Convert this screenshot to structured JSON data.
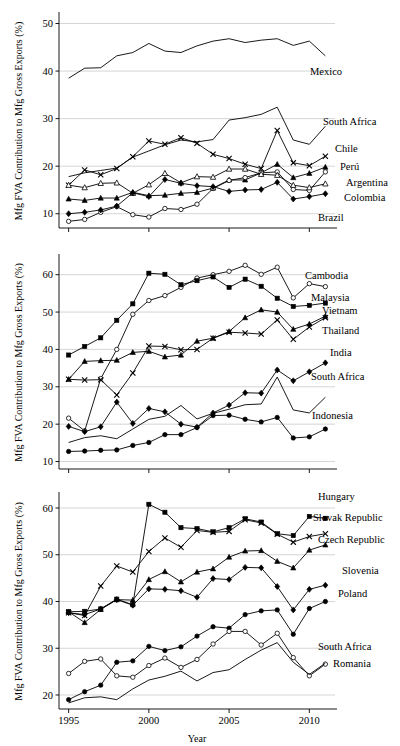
{
  "figure": {
    "xlabel": "Year",
    "ylabel": "Mfg FVA Contribution to Mfg Gross Exports (%)",
    "x_ticks": [
      "1995",
      "2000",
      "2005",
      "2010"
    ],
    "x_tick_values": [
      1995,
      2000,
      2005,
      2010
    ],
    "xlim": [
      1994.4,
      2011.6
    ],
    "grid": "horizontal",
    "legend_position": "right-inline-labels",
    "line_color": "#000000",
    "grid_color": "#b9b9b9"
  },
  "chart_data": [
    {
      "type": "line",
      "panel": "top",
      "title": "",
      "xlabel": "",
      "ylabel": "Mfg FVA Contribution to Mfg Gross Exports (%)",
      "ylim": [
        7,
        52
      ],
      "y_ticks": [
        10,
        20,
        30,
        40,
        50
      ],
      "y_tick_labels": [
        "10",
        "20",
        "30",
        "40",
        "50"
      ],
      "x": [
        1995,
        1996,
        1997,
        1998,
        1999,
        2000,
        2001,
        2002,
        2003,
        2004,
        2005,
        2006,
        2007,
        2008,
        2009,
        2010,
        2011
      ],
      "series": [
        {
          "name": "Mexico",
          "marker": "none",
          "label": "Mexico",
          "values": [
            38.5,
            40.6,
            40.7,
            43.2,
            43.9,
            45.8,
            44.2,
            43.9,
            45.3,
            46.3,
            46.8,
            46.0,
            46.5,
            46.8,
            45.4,
            46.3,
            43.2
          ]
        },
        {
          "name": "South Africa",
          "marker": "none",
          "label": "South Africa",
          "values": [
            17.8,
            18.6,
            19.1,
            19.6,
            21.9,
            23.2,
            24.5,
            25.5,
            25.1,
            25.6,
            29.7,
            30.2,
            30.9,
            32.4,
            25.5,
            24.6,
            28.4
          ]
        },
        {
          "name": "Chile",
          "marker": "x",
          "label": "Chile",
          "values": [
            16.0,
            19.2,
            18.2,
            19.5,
            22.0,
            25.3,
            24.6,
            26.0,
            24.8,
            22.5,
            21.6,
            20.4,
            19.5,
            27.5,
            20.7,
            20.1,
            22.1
          ]
        },
        {
          "name": "Perú",
          "marker": "filled-triangle",
          "label": "Perú",
          "values": [
            13.1,
            12.8,
            13.3,
            13.3,
            14.5,
            13.8,
            13.9,
            14.3,
            14.5,
            15.4,
            17.1,
            17.1,
            18.6,
            20.4,
            17.6,
            18.5,
            19.8
          ]
        },
        {
          "name": "Argentina",
          "marker": "open-circle",
          "label": "Argentina",
          "values": [
            8.4,
            8.8,
            10.3,
            11.5,
            9.8,
            9.3,
            11.1,
            10.9,
            12.0,
            15.3,
            17.0,
            17.6,
            18.6,
            18.8,
            15.1,
            14.9,
            18.8
          ]
        },
        {
          "name": "Colombia",
          "marker": "open-triangle",
          "label": "Colombia",
          "values": [
            16.0,
            15.5,
            16.4,
            16.5,
            14.3,
            16.1,
            18.5,
            16.5,
            17.8,
            17.7,
            19.4,
            19.4,
            18.3,
            18.1,
            16.0,
            15.5,
            16.3
          ]
        },
        {
          "name": "Brazil",
          "marker": "filled-diamond",
          "label": "Brazil",
          "values": [
            10.0,
            10.3,
            10.8,
            11.6,
            14.4,
            13.6,
            17.2,
            16.4,
            15.9,
            15.7,
            14.7,
            15.0,
            15.1,
            16.6,
            13.1,
            13.6,
            14.2
          ]
        }
      ]
    },
    {
      "type": "line",
      "panel": "middle",
      "title": "",
      "xlabel": "",
      "ylabel": "Mfg FVA Contribution to Mfg Gross Exports (%)",
      "ylim": [
        8,
        65
      ],
      "y_ticks": [
        10,
        20,
        30,
        40,
        50,
        60
      ],
      "y_tick_labels": [
        "10",
        "20",
        "30",
        "40",
        "50",
        "60"
      ],
      "x": [
        1995,
        1996,
        1997,
        1998,
        1999,
        2000,
        2001,
        2002,
        2003,
        2004,
        2005,
        2006,
        2007,
        2008,
        2009,
        2010,
        2011
      ],
      "series": [
        {
          "name": "Cambodia",
          "marker": "open-circle",
          "label": "Cambodia",
          "values": [
            21.6,
            18.2,
            32.2,
            40.0,
            49.4,
            53.1,
            54.4,
            56.6,
            59.1,
            60.0,
            60.9,
            62.5,
            60.1,
            62.0,
            53.8,
            57.6,
            56.8
          ]
        },
        {
          "name": "Malaysia",
          "marker": "filled-square",
          "label": "Malaysia",
          "values": [
            38.5,
            40.8,
            43.1,
            47.8,
            52.2,
            60.4,
            60.1,
            57.3,
            58.4,
            59.4,
            56.6,
            58.8,
            56.9,
            53.7,
            51.5,
            51.8,
            52.4
          ]
        },
        {
          "name": "Vietnam",
          "marker": "filled-triangle",
          "label": "Vietnam",
          "values": [
            32.0,
            36.8,
            37.0,
            37.1,
            39.2,
            39.5,
            38.0,
            38.5,
            42.2,
            43.0,
            44.8,
            48.5,
            50.6,
            50.0,
            45.4,
            46.8,
            48.9
          ]
        },
        {
          "name": "Thailand",
          "marker": "x",
          "label": "Thailand",
          "values": [
            32.0,
            31.8,
            31.9,
            27.8,
            33.7,
            40.9,
            40.8,
            39.9,
            40.0,
            43.0,
            44.6,
            44.4,
            44.1,
            47.9,
            42.7,
            46.0,
            48.5
          ]
        },
        {
          "name": "India",
          "marker": "filled-circle",
          "label": "India",
          "values": [
            12.7,
            12.8,
            13.0,
            13.1,
            14.3,
            15.1,
            17.2,
            17.2,
            19.1,
            22.3,
            22.4,
            21.3,
            20.6,
            21.8,
            16.3,
            16.6,
            18.7
          ]
        },
        {
          "name": "South Africa",
          "marker": "filled-diamond",
          "label": "South Africa",
          "values": [
            19.4,
            18.0,
            19.3,
            25.9,
            20.2,
            24.2,
            23.3,
            20.0,
            19.2,
            23.0,
            25.1,
            28.4,
            28.3,
            34.5,
            31.6,
            34.0,
            36.4
          ]
        },
        {
          "name": "Indonesia",
          "marker": "none",
          "label": "Indonesia",
          "values": [
            15.1,
            16.4,
            16.9,
            16.1,
            18.7,
            21.3,
            22.1,
            25.0,
            21.4,
            22.9,
            24.0,
            25.2,
            25.4,
            32.6,
            23.8,
            23.0,
            27.2
          ]
        }
      ]
    },
    {
      "type": "line",
      "panel": "bottom",
      "title": "",
      "xlabel": "Year",
      "ylabel": "Mfg FVA Contribution to Mfg Gross Exports (%)",
      "ylim": [
        17,
        63
      ],
      "y_ticks": [
        20,
        30,
        40,
        50,
        60
      ],
      "y_tick_labels": [
        "20",
        "30",
        "40",
        "50",
        "60"
      ],
      "x": [
        1995,
        1996,
        1997,
        1998,
        1999,
        2000,
        2001,
        2002,
        2003,
        2004,
        2005,
        2006,
        2007,
        2008,
        2009,
        2010,
        2011
      ],
      "series": [
        {
          "name": "Hungary",
          "marker": "filled-square",
          "label": "Hungary",
          "values": [
            37.8,
            37.9,
            38.4,
            40.5,
            39.3,
            60.8,
            59.1,
            55.8,
            55.6,
            54.9,
            55.8,
            57.7,
            57.0,
            54.5,
            54.1,
            58.2,
            57.8
          ]
        },
        {
          "name": "Slovak Republic",
          "marker": "x",
          "label": "Slovak Republic",
          "values": [
            37.6,
            37.0,
            43.3,
            47.6,
            46.3,
            50.7,
            53.6,
            51.6,
            55.2,
            54.8,
            55.0,
            57.5,
            56.8,
            54.4,
            52.7,
            53.9,
            54.5
          ]
        },
        {
          "name": "Czech Republic",
          "marker": "filled-triangle",
          "label": "Czech Republic",
          "values": [
            37.8,
            35.5,
            38.3,
            40.4,
            40.3,
            44.7,
            46.4,
            44.2,
            46.3,
            47.0,
            49.5,
            50.8,
            50.9,
            48.6,
            47.2,
            51.0,
            52.1
          ]
        },
        {
          "name": "Slovenia",
          "marker": "filled-diamond",
          "label": "Slovenia",
          "values": [
            37.6,
            37.2,
            38.4,
            40.4,
            39.2,
            42.7,
            42.6,
            42.3,
            40.9,
            44.9,
            44.7,
            47.3,
            47.2,
            43.2,
            38.2,
            42.6,
            43.5
          ]
        },
        {
          "name": "Poland",
          "marker": "filled-circle",
          "label": "Poland",
          "values": [
            19.0,
            20.7,
            22.1,
            27.0,
            27.3,
            30.4,
            29.5,
            30.3,
            32.6,
            34.6,
            34.3,
            37.2,
            38.0,
            38.2,
            33.0,
            38.5,
            40.0
          ]
        },
        {
          "name": "South Africa",
          "marker": "open-circle",
          "label": "South Africa",
          "values": [
            24.6,
            27.2,
            27.7,
            24.1,
            23.8,
            26.3,
            27.9,
            25.9,
            27.6,
            30.9,
            33.6,
            33.6,
            30.7,
            33.2,
            28.0,
            24.1,
            26.6
          ]
        },
        {
          "name": "Romania",
          "marker": "none",
          "label": "Romania",
          "values": [
            18.3,
            19.4,
            19.6,
            19.0,
            21.3,
            23.2,
            24.0,
            25.1,
            23.0,
            24.8,
            25.4,
            27.6,
            29.6,
            31.2,
            27.0,
            24.4,
            26.8
          ]
        }
      ]
    }
  ],
  "panel_labels": {
    "top": [
      "Mexico",
      "South Africa",
      "Chile",
      "Perú",
      "Argentina",
      "Colombia",
      "Brazil"
    ],
    "middle": [
      "Cambodia",
      "Malaysia",
      "Vietnam",
      "Thailand",
      "India",
      "South Africa",
      "Indonesia"
    ],
    "bottom": [
      "Hungary",
      "Slovak Republic",
      "Czech Republic",
      "Slovenia",
      "Poland",
      "South Africa",
      "Romania"
    ]
  },
  "label_anchors": {
    "top": [
      {
        "x": 310,
        "y": 75
      },
      {
        "x": 323,
        "y": 125
      },
      {
        "x": 335,
        "y": 152
      },
      {
        "x": 340,
        "y": 170
      },
      {
        "x": 346,
        "y": 186
      },
      {
        "x": 344,
        "y": 201
      },
      {
        "x": 318,
        "y": 221
      }
    ],
    "middle": [
      {
        "x": 305,
        "y": 279
      },
      {
        "x": 311,
        "y": 301
      },
      {
        "x": 322,
        "y": 314
      },
      {
        "x": 322,
        "y": 334
      },
      {
        "x": 330,
        "y": 356
      },
      {
        "x": 311,
        "y": 380
      },
      {
        "x": 312,
        "y": 419
      }
    ],
    "bottom": [
      {
        "x": 318,
        "y": 500
      },
      {
        "x": 313,
        "y": 521
      },
      {
        "x": 318,
        "y": 543
      },
      {
        "x": 342,
        "y": 574
      },
      {
        "x": 338,
        "y": 597
      },
      {
        "x": 318,
        "y": 650
      },
      {
        "x": 333,
        "y": 667
      }
    ]
  }
}
